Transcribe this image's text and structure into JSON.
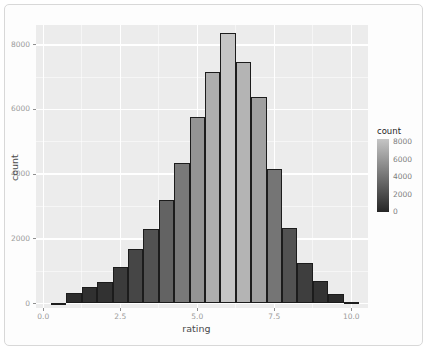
{
  "chart_data": {
    "type": "bar",
    "subtype": "histogram",
    "title": "",
    "xlabel": "rating",
    "ylabel": "count",
    "binwidth": 0.5,
    "bin_centers": [
      0.5,
      1.0,
      1.5,
      2.0,
      2.5,
      3.0,
      3.5,
      4.0,
      4.5,
      5.0,
      5.5,
      6.0,
      6.5,
      7.0,
      7.5,
      8.0,
      8.5,
      9.0,
      9.5,
      10.0
    ],
    "counts": [
      20,
      330,
      520,
      650,
      1130,
      1700,
      2290,
      3190,
      4340,
      5770,
      7170,
      8360,
      7480,
      6390,
      4150,
      2320,
      1240,
      690,
      280,
      50
    ],
    "xlim": [
      -0.25,
      10.75
    ],
    "ylim": [
      0,
      8700
    ],
    "x_ticks": [
      {
        "v": 0.0,
        "label": "0.0"
      },
      {
        "v": 2.5,
        "label": "2.5"
      },
      {
        "v": 5.0,
        "label": "5.0"
      },
      {
        "v": 7.5,
        "label": "7.5"
      },
      {
        "v": 10.0,
        "label": "10.0"
      }
    ],
    "y_ticks": [
      {
        "v": 0,
        "label": "0"
      },
      {
        "v": 2000,
        "label": "2000"
      },
      {
        "v": 4000,
        "label": "4000"
      },
      {
        "v": 6000,
        "label": "6000"
      },
      {
        "v": 8000,
        "label": "8000"
      }
    ],
    "x_minor_ticks": [
      1.25,
      3.75,
      6.25,
      8.75
    ],
    "y_minor_ticks": [
      1000,
      3000,
      5000,
      7000
    ],
    "grid": true,
    "legend_position": "right",
    "legend": {
      "title": "count",
      "min": 0,
      "max": 8360,
      "ticks": [
        {
          "v": 8000,
          "label": "8000"
        },
        {
          "v": 6000,
          "label": "6000"
        },
        {
          "v": 4000,
          "label": "4000"
        },
        {
          "v": 2000,
          "label": "2000"
        },
        {
          "v": 0,
          "label": "0"
        }
      ]
    },
    "colors": {
      "panel_bg": "#ececec",
      "grid": "#ffffff",
      "bar_border": "#1c1c1c",
      "fill_low": "#262626",
      "fill_high": "#c5c5c5",
      "axis_text": "#9b9b9b",
      "axis_title": "#4a4a4a",
      "legend_title": "#1f1f1f"
    }
  }
}
